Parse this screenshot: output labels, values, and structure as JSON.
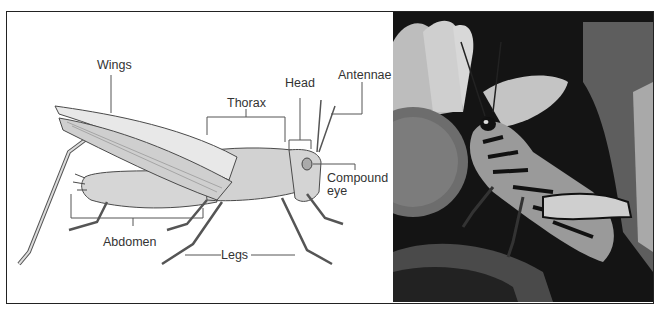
{
  "figure": {
    "labels": {
      "wings": "Wings",
      "thorax": "Thorax",
      "head": "Head",
      "antennae": "Antennae",
      "compound_eye_line1": "Compound",
      "compound_eye_line2": "eye",
      "abdomen": "Abdomen",
      "legs": "Legs"
    },
    "colors": {
      "frame": "#222222",
      "label_text": "#333333",
      "leader_lines": "#555555",
      "illustration_fill": "#d9d9d9",
      "illustration_stroke": "#4a4a4a",
      "photo_background": "#111111"
    }
  }
}
